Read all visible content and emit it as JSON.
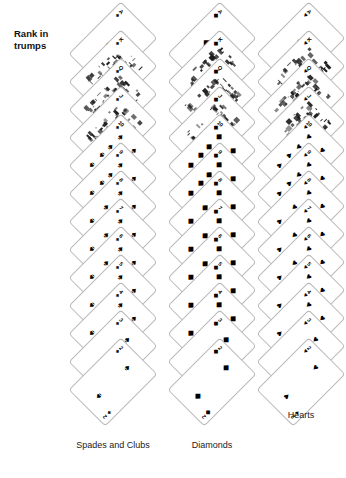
{
  "heading": {
    "text": "Rank in\ntrumps"
  },
  "columns": [
    {
      "id": "spades",
      "label": "Spades and Clubs",
      "label_y": 440,
      "suit_symbol": "♠",
      "start_y": 46,
      "step": 28,
      "cards": [
        {
          "rank": "A",
          "pips": 1,
          "kind": "ace"
        },
        {
          "rank": "K",
          "pips": 0,
          "kind": "court"
        },
        {
          "rank": "Q",
          "pips": 0,
          "kind": "court"
        },
        {
          "rank": "J",
          "pips": 0,
          "kind": "court"
        },
        {
          "rank": "10",
          "pips": 10,
          "kind": "pip"
        },
        {
          "rank": "9",
          "pips": 9,
          "kind": "pip"
        },
        {
          "rank": "8",
          "pips": 8,
          "kind": "pip"
        },
        {
          "rank": "7",
          "pips": 7,
          "kind": "pip"
        },
        {
          "rank": "6",
          "pips": 6,
          "kind": "pip"
        },
        {
          "rank": "5",
          "pips": 5,
          "kind": "pip"
        },
        {
          "rank": "4",
          "pips": 4,
          "kind": "pip"
        },
        {
          "rank": "3",
          "pips": 3,
          "kind": "pip"
        },
        {
          "rank": "2",
          "pips": 2,
          "kind": "pip"
        }
      ]
    },
    {
      "id": "diamonds",
      "label": "Diamonds",
      "label_y": 440,
      "suit_symbol": "◆",
      "start_y": 46,
      "step": 28,
      "cards": [
        {
          "rank": "A",
          "pips": 1,
          "kind": "ace"
        },
        {
          "rank": "K",
          "pips": 0,
          "kind": "court"
        },
        {
          "rank": "Q",
          "pips": 0,
          "kind": "court"
        },
        {
          "rank": "J",
          "pips": 0,
          "kind": "court"
        },
        {
          "rank": "10",
          "pips": 10,
          "kind": "pip"
        },
        {
          "rank": "9",
          "pips": 9,
          "kind": "pip"
        },
        {
          "rank": "8",
          "pips": 8,
          "kind": "pip"
        },
        {
          "rank": "7",
          "pips": 7,
          "kind": "pip"
        },
        {
          "rank": "6",
          "pips": 6,
          "kind": "pip"
        },
        {
          "rank": "5",
          "pips": 5,
          "kind": "pip"
        },
        {
          "rank": "4",
          "pips": 4,
          "kind": "pip"
        },
        {
          "rank": "3",
          "pips": 3,
          "kind": "pip"
        },
        {
          "rank": "2",
          "pips": 2,
          "kind": "pip"
        }
      ]
    },
    {
      "id": "hearts",
      "label": "Hearts",
      "label_y": 410,
      "suit_symbol": "♥",
      "start_y": 46,
      "step": 28,
      "cards": [
        {
          "rank": "A",
          "pips": 1,
          "kind": "ace"
        },
        {
          "rank": "K",
          "pips": 0,
          "kind": "court"
        },
        {
          "rank": "Q",
          "pips": 0,
          "kind": "court"
        },
        {
          "rank": "J",
          "pips": 0,
          "kind": "court"
        },
        {
          "rank": "10",
          "pips": 10,
          "kind": "pip"
        },
        {
          "rank": "9",
          "pips": 9,
          "kind": "pip"
        },
        {
          "rank": "8",
          "pips": 8,
          "kind": "pip"
        },
        {
          "rank": "7",
          "pips": 7,
          "kind": "pip"
        },
        {
          "rank": "6",
          "pips": 6,
          "kind": "pip"
        },
        {
          "rank": "5",
          "pips": 5,
          "kind": "pip"
        },
        {
          "rank": "4",
          "pips": 4,
          "kind": "pip"
        },
        {
          "rank": "3",
          "pips": 3,
          "kind": "pip"
        },
        {
          "rank": "2",
          "pips": 2,
          "kind": "pip"
        }
      ]
    }
  ],
  "colors": {
    "card_border": "#b9b9b9",
    "pip_ink": "#000000",
    "text": "#111111",
    "background": "#ffffff"
  },
  "pip_layouts": {
    "1": [
      [
        50,
        50
      ]
    ],
    "2": [
      [
        50,
        16
      ],
      [
        50,
        84
      ]
    ],
    "3": [
      [
        50,
        16
      ],
      [
        50,
        50
      ],
      [
        50,
        84
      ]
    ],
    "4": [
      [
        22,
        16
      ],
      [
        78,
        16
      ],
      [
        22,
        84
      ],
      [
        78,
        84
      ]
    ],
    "5": [
      [
        22,
        16
      ],
      [
        78,
        16
      ],
      [
        50,
        50
      ],
      [
        22,
        84
      ],
      [
        78,
        84
      ]
    ],
    "6": [
      [
        22,
        16
      ],
      [
        78,
        16
      ],
      [
        22,
        50
      ],
      [
        78,
        50
      ],
      [
        22,
        84
      ],
      [
        78,
        84
      ]
    ],
    "7": [
      [
        22,
        16
      ],
      [
        78,
        16
      ],
      [
        50,
        33
      ],
      [
        22,
        50
      ],
      [
        78,
        50
      ],
      [
        22,
        84
      ],
      [
        78,
        84
      ]
    ],
    "8": [
      [
        22,
        16
      ],
      [
        78,
        16
      ],
      [
        50,
        33
      ],
      [
        22,
        50
      ],
      [
        78,
        50
      ],
      [
        50,
        67
      ],
      [
        22,
        84
      ],
      [
        78,
        84
      ]
    ],
    "9": [
      [
        22,
        16
      ],
      [
        78,
        16
      ],
      [
        22,
        39
      ],
      [
        78,
        39
      ],
      [
        50,
        50
      ],
      [
        22,
        61
      ],
      [
        78,
        61
      ],
      [
        22,
        84
      ],
      [
        78,
        84
      ]
    ],
    "10": [
      [
        22,
        16
      ],
      [
        78,
        16
      ],
      [
        50,
        27
      ],
      [
        22,
        39
      ],
      [
        78,
        39
      ],
      [
        22,
        61
      ],
      [
        78,
        61
      ],
      [
        50,
        73
      ],
      [
        22,
        84
      ],
      [
        78,
        84
      ]
    ]
  }
}
